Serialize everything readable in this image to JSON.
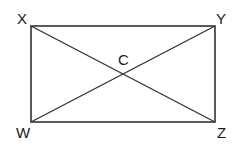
{
  "diagram": {
    "type": "rectangle-with-diagonals",
    "vertices": {
      "X": {
        "label": "X",
        "x": 31,
        "y": 26
      },
      "Y": {
        "label": "Y",
        "x": 215,
        "y": 26
      },
      "Z": {
        "label": "Z",
        "x": 215,
        "y": 122
      },
      "W": {
        "label": "W",
        "x": 31,
        "y": 122
      }
    },
    "intersection": {
      "label": "C",
      "x": 123,
      "y": 74
    },
    "segments": [
      "XY",
      "YZ",
      "ZW",
      "WX",
      "XZ",
      "YW"
    ],
    "stroke_color": "#333333"
  }
}
